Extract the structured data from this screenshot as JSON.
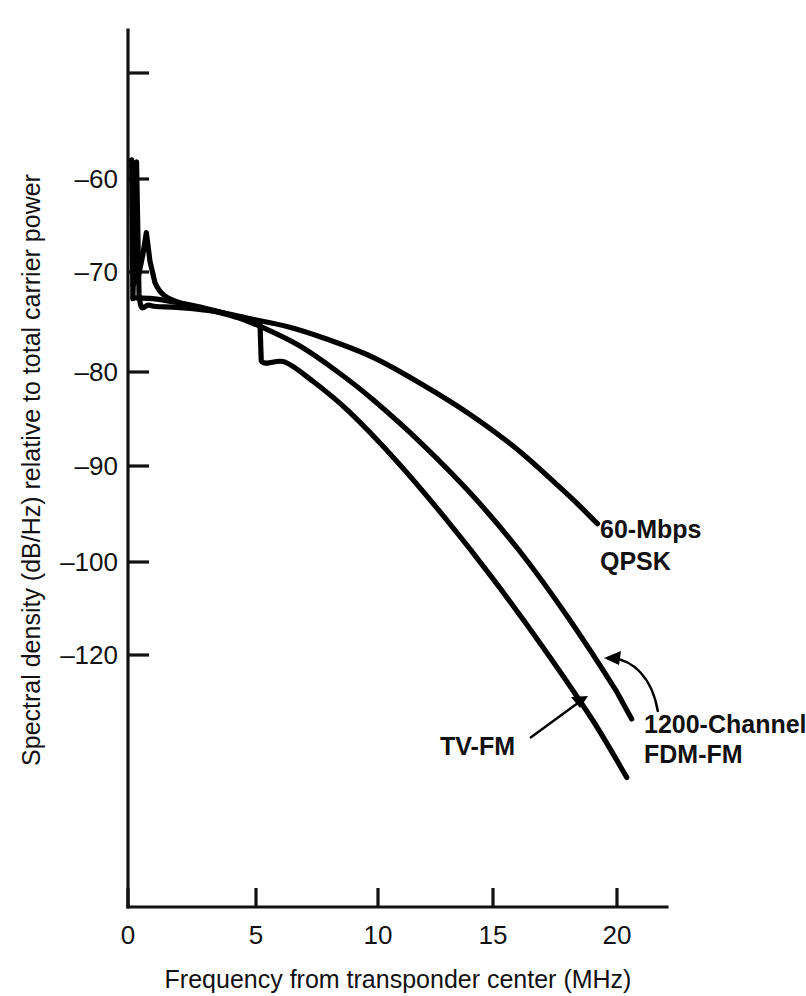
{
  "chart_data": {
    "type": "line",
    "title": "",
    "xlabel": "Frequency from transponder center (MHz)",
    "ylabel": "Spectral density (dB/Hz) relative to total carrier power",
    "xlim": [
      0,
      22
    ],
    "ylim": [
      -130,
      -50
    ],
    "grid": false,
    "legend_position": "inline-annotations",
    "xticks": [
      0,
      5,
      10,
      15,
      20
    ],
    "xtick_labels": [
      "0",
      "5",
      "10",
      "15",
      "20"
    ],
    "yticks": [
      -50,
      -60,
      -70,
      -80,
      -90,
      -100,
      -120
    ],
    "ytick_labels": [
      "",
      "–60",
      "–70",
      "–80",
      "–90",
      "–100",
      "–120"
    ],
    "series": [
      {
        "name": "60-Mbps QPSK",
        "label": "60-Mbps\nQPSK",
        "label_line1": "60-Mbps",
        "label_line2": "QPSK",
        "color": "#000000",
        "points": [
          [
            0.15,
            -58.0
          ],
          [
            0.2,
            -72.5
          ],
          [
            0.35,
            -58.2
          ],
          [
            0.45,
            -72.0
          ],
          [
            0.9,
            -73.2
          ],
          [
            2.0,
            -73.4
          ],
          [
            3.5,
            -73.8
          ],
          [
            5.0,
            -74.6
          ],
          [
            6.5,
            -75.4
          ],
          [
            8.0,
            -76.6
          ],
          [
            10.0,
            -78.6
          ],
          [
            12.0,
            -81.4
          ],
          [
            14.0,
            -84.6
          ],
          [
            16.0,
            -88.4
          ],
          [
            18.0,
            -93.0
          ],
          [
            19.2,
            -96.0
          ]
        ]
      },
      {
        "name": "TV-FM",
        "label": "TV-FM",
        "color": "#000000",
        "points": [
          [
            0.2,
            -71.0
          ],
          [
            0.4,
            -70.5
          ],
          [
            0.6,
            -68.0
          ],
          [
            0.75,
            -65.6
          ],
          [
            0.9,
            -68.6
          ],
          [
            1.1,
            -70.8
          ],
          [
            1.5,
            -72.2
          ],
          [
            2.2,
            -73.0
          ],
          [
            3.2,
            -73.6
          ],
          [
            4.4,
            -74.4
          ],
          [
            5.4,
            -75.2
          ],
          [
            5.45,
            -79.0
          ],
          [
            6.4,
            -79.1
          ],
          [
            7.5,
            -81.0
          ],
          [
            9.0,
            -84.2
          ],
          [
            11.0,
            -89.5
          ],
          [
            13.0,
            -95.5
          ],
          [
            15.0,
            -102.0
          ],
          [
            17.0,
            -109.0
          ],
          [
            19.0,
            -116.5
          ],
          [
            20.4,
            -122.5
          ]
        ]
      },
      {
        "name": "1200-Channel FDM-FM",
        "label": "1200-Channel\nFDM-FM",
        "label_line1": "1200-Channel",
        "label_line2": "FDM-FM",
        "color": "#000000",
        "points": [
          [
            0.2,
            -72.4
          ],
          [
            1.0,
            -72.5
          ],
          [
            2.0,
            -72.9
          ],
          [
            3.0,
            -73.4
          ],
          [
            4.2,
            -74.2
          ],
          [
            5.5,
            -75.5
          ],
          [
            7.0,
            -77.4
          ],
          [
            8.5,
            -80.0
          ],
          [
            10.0,
            -83.0
          ],
          [
            12.0,
            -87.6
          ],
          [
            14.0,
            -92.8
          ],
          [
            16.0,
            -98.8
          ],
          [
            18.0,
            -105.8
          ],
          [
            20.0,
            -113.6
          ],
          [
            20.6,
            -116.4
          ]
        ]
      }
    ],
    "annotations": [
      {
        "text": "60-Mbps QPSK",
        "x": 21.0,
        "y": -98.0
      },
      {
        "text": "TV-FM",
        "x": 15.5,
        "y": -126.5
      },
      {
        "text": "1200-Channel FDM-FM",
        "x": 21.5,
        "y": -124.0
      }
    ]
  },
  "axes": {
    "y_axis_title": "Spectral density (dB/Hz) relative to total carrier power",
    "x_axis_title": "Frequency from transponder center (MHz)",
    "y_labels": [
      "–60",
      "–70",
      "–80",
      "–90",
      "–100",
      "–120"
    ],
    "x_labels": [
      "0",
      "5",
      "10",
      "15",
      "20"
    ]
  },
  "labels": {
    "qpsk_line1": "60-Mbps",
    "qpsk_line2": "QPSK",
    "tvfm": "TV-FM",
    "fdm_line1": "1200-Channel",
    "fdm_line2": "FDM-FM"
  },
  "style": {
    "ink": "#000000",
    "background": "#ffffff"
  }
}
